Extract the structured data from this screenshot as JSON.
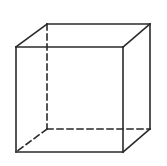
{
  "diagram": {
    "type": "wireframe-cube",
    "background": "#ffffff",
    "stroke_color": "#2a2a2a",
    "stroke_width": 1.6,
    "dash_pattern": "6,4",
    "vertices": {
      "front_top_left": [
        16,
        47
      ],
      "front_top_right": [
        123,
        47
      ],
      "front_bottom_left": [
        16,
        152
      ],
      "front_bottom_right": [
        123,
        152
      ],
      "back_top_left": [
        47,
        24
      ],
      "back_top_right": [
        150,
        24
      ],
      "back_bottom_left": [
        47,
        129
      ],
      "back_bottom_right": [
        150,
        129
      ]
    },
    "visible_edges": [
      [
        "front_top_left",
        "front_top_right"
      ],
      [
        "front_top_right",
        "front_bottom_right"
      ],
      [
        "front_bottom_right",
        "front_bottom_left"
      ],
      [
        "front_bottom_left",
        "front_top_left"
      ],
      [
        "front_top_left",
        "back_top_left"
      ],
      [
        "back_top_left",
        "back_top_right"
      ],
      [
        "back_top_right",
        "front_top_right"
      ],
      [
        "back_top_right",
        "back_bottom_right"
      ],
      [
        "back_bottom_right",
        "front_bottom_right"
      ]
    ],
    "hidden_edges": [
      [
        "back_top_left",
        "back_bottom_left"
      ],
      [
        "back_bottom_left",
        "back_bottom_right"
      ],
      [
        "back_bottom_left",
        "front_bottom_left"
      ]
    ]
  }
}
